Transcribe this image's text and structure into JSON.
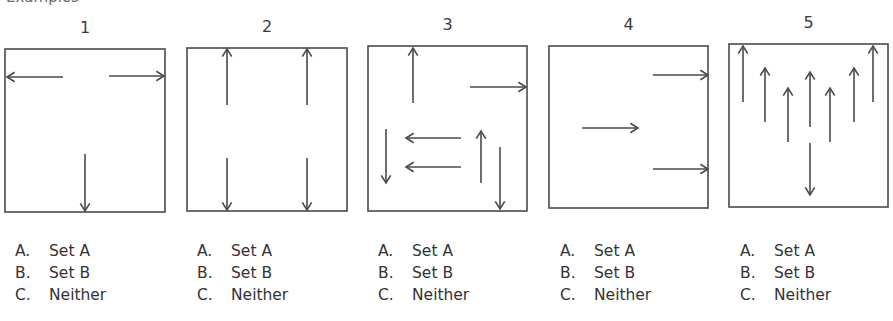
{
  "heading_fragment": "Examples",
  "panels": [
    {
      "number": "1",
      "box": {
        "x": 5,
        "y": 49,
        "w": 160,
        "h": 163
      },
      "arrows": [
        {
          "x1": 58,
          "y1": 28,
          "x2": 2,
          "y2": 28
        },
        {
          "x1": 104,
          "y1": 27,
          "x2": 159,
          "y2": 27
        },
        {
          "x1": 80,
          "y1": 105,
          "x2": 80,
          "y2": 162
        }
      ]
    },
    {
      "number": "2",
      "box": {
        "x": 187,
        "y": 48,
        "w": 160,
        "h": 163
      },
      "arrows": [
        {
          "x1": 40,
          "y1": 57,
          "x2": 40,
          "y2": 1
        },
        {
          "x1": 120,
          "y1": 57,
          "x2": 120,
          "y2": 1
        },
        {
          "x1": 40,
          "y1": 110,
          "x2": 40,
          "y2": 162
        },
        {
          "x1": 120,
          "y1": 110,
          "x2": 120,
          "y2": 162
        }
      ]
    },
    {
      "number": "3",
      "box": {
        "x": 368,
        "y": 46,
        "w": 159,
        "h": 165
      },
      "arrows": [
        {
          "x1": 45,
          "y1": 57,
          "x2": 45,
          "y2": 2
        },
        {
          "x1": 102,
          "y1": 41,
          "x2": 158,
          "y2": 41
        },
        {
          "x1": 93,
          "y1": 92,
          "x2": 38,
          "y2": 92
        },
        {
          "x1": 93,
          "y1": 121,
          "x2": 38,
          "y2": 121
        },
        {
          "x1": 18,
          "y1": 83,
          "x2": 18,
          "y2": 137
        },
        {
          "x1": 113,
          "y1": 137,
          "x2": 113,
          "y2": 85
        },
        {
          "x1": 132,
          "y1": 101,
          "x2": 132,
          "y2": 163
        }
      ]
    },
    {
      "number": "4",
      "box": {
        "x": 549,
        "y": 46,
        "w": 159,
        "h": 162
      },
      "arrows": [
        {
          "x1": 104,
          "y1": 29,
          "x2": 159,
          "y2": 29
        },
        {
          "x1": 33,
          "y1": 82,
          "x2": 89,
          "y2": 82
        },
        {
          "x1": 104,
          "y1": 123,
          "x2": 159,
          "y2": 123
        }
      ]
    },
    {
      "number": "5",
      "box": {
        "x": 729,
        "y": 44,
        "w": 159,
        "h": 163
      },
      "arrows": [
        {
          "x1": 14,
          "y1": 58,
          "x2": 14,
          "y2": 2
        },
        {
          "x1": 36,
          "y1": 78,
          "x2": 36,
          "y2": 24
        },
        {
          "x1": 59,
          "y1": 98,
          "x2": 59,
          "y2": 44
        },
        {
          "x1": 81,
          "y1": 83,
          "x2": 81,
          "y2": 28
        },
        {
          "x1": 101,
          "y1": 98,
          "x2": 101,
          "y2": 44
        },
        {
          "x1": 125,
          "y1": 78,
          "x2": 125,
          "y2": 24
        },
        {
          "x1": 144,
          "y1": 58,
          "x2": 144,
          "y2": 2
        },
        {
          "x1": 81,
          "y1": 99,
          "x2": 81,
          "y2": 151
        }
      ]
    }
  ],
  "options": [
    {
      "letter": "A.",
      "label": "Set A"
    },
    {
      "letter": "B.",
      "label": "Set B"
    },
    {
      "letter": "C.",
      "label": "Neither"
    }
  ],
  "colors": {
    "stroke": "#4a4a4a",
    "text": "#333333"
  }
}
